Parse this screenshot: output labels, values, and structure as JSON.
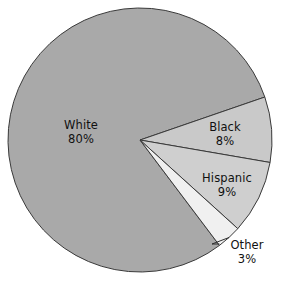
{
  "chart_data": {
    "type": "pie",
    "title": "",
    "subtitle": "",
    "xlabel": "",
    "ylabel": "",
    "legend_position": "none",
    "grid": false,
    "labels_inside": true,
    "value_suffix": "%",
    "categories": [
      "White",
      "Black",
      "Hispanic",
      "Other"
    ],
    "values": [
      80,
      8,
      9,
      3
    ],
    "slices": [
      {
        "name": "White",
        "value": 80,
        "value_label": "80%",
        "color": "#a9a9a9",
        "start_angle": 341,
        "end_angle": 629,
        "label_placement": "inside"
      },
      {
        "name": "Black",
        "value": 8,
        "value_label": "8%",
        "color": "#c9c9c9",
        "start_angle": 341,
        "end_angle": 12.2,
        "label_placement": "inside"
      },
      {
        "name": "Hispanic",
        "value": 9,
        "value_label": "9%",
        "color": "#cfcfcf",
        "start_angle": 12.2,
        "end_angle": 44.6,
        "label_placement": "inside"
      },
      {
        "name": "Other",
        "value": 3,
        "value_label": "3%",
        "color": "#f0f0f0",
        "start_angle": 44.6,
        "end_angle": 55.4,
        "label_placement": "outside-leader"
      }
    ],
    "geometry": {
      "center_x": 140,
      "center_y": 140,
      "radius": 132
    },
    "style": {
      "background": "#ffffff",
      "outline_color": "#3a3a3a",
      "outline_width": 1,
      "text_color": "#111111",
      "leader_line_color": "#2f2f2f"
    }
  },
  "labels": {
    "white": {
      "name": "White",
      "value": "80%"
    },
    "black": {
      "name": "Black",
      "value": "8%"
    },
    "hispanic": {
      "name": "Hispanic",
      "value": "9%"
    },
    "other": {
      "name": "Other",
      "value": "3%"
    }
  }
}
